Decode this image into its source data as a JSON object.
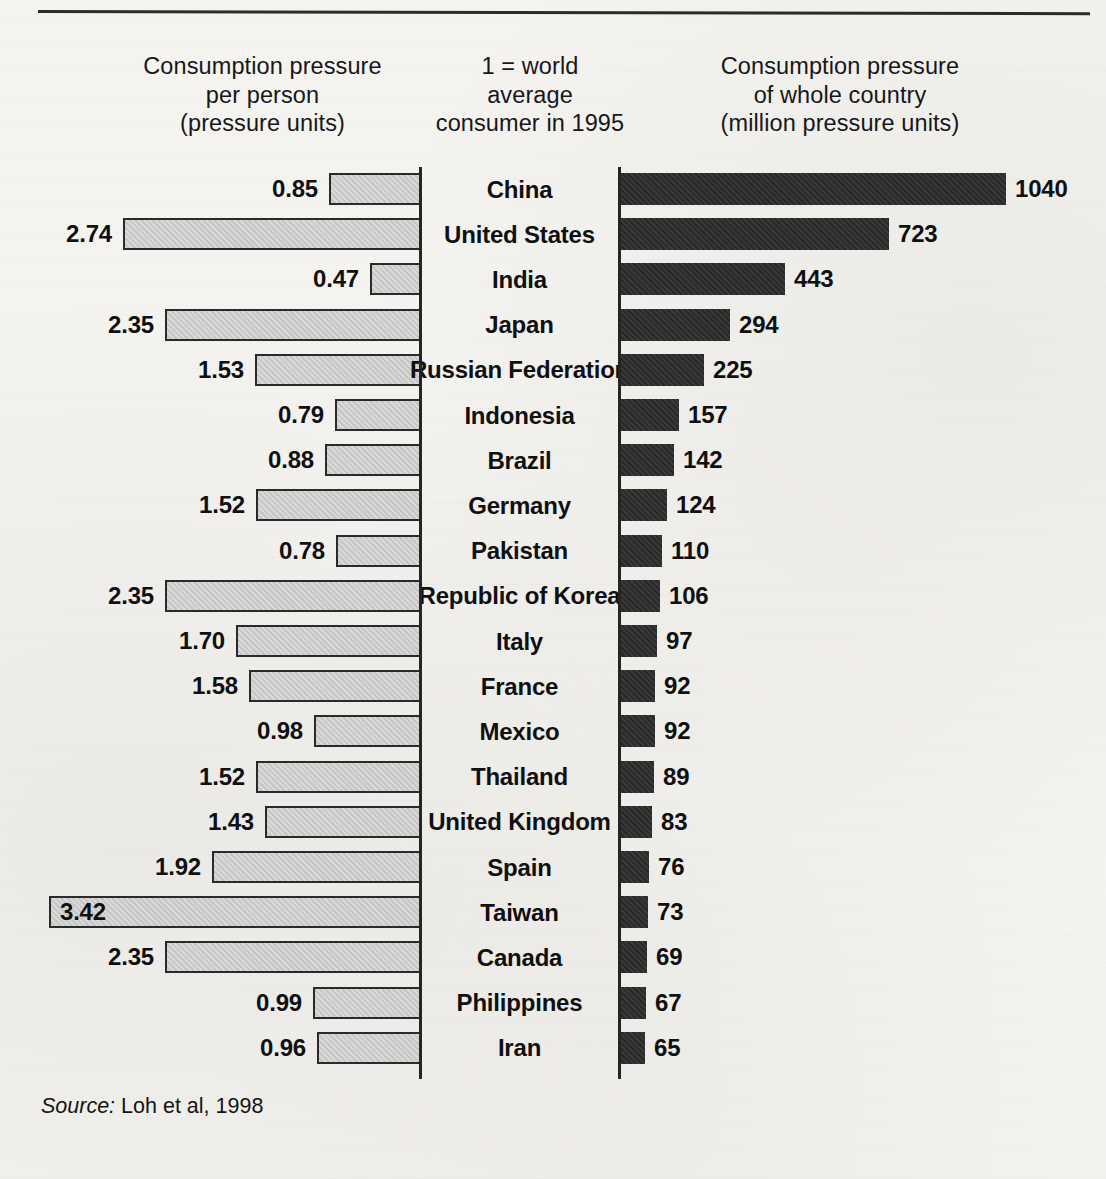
{
  "figure": {
    "top_rule": true,
    "source_label": "Source:",
    "source_text": "Loh et al, 1998"
  },
  "headers": {
    "left": [
      "Consumption pressure",
      "per person",
      "(pressure units)"
    ],
    "middle": [
      "1 = world",
      "average",
      "consumer in 1995"
    ],
    "right": [
      "Consumption pressure",
      "of whole country",
      "(million pressure units)"
    ]
  },
  "colors": {
    "page_background": "#f4f3f0",
    "left_bar_fill": "#c9c9c9",
    "left_bar_stroke": "#2a2a2a",
    "right_bar_fill": "#2d2d2d",
    "axis": "#252525",
    "text": "#101010"
  },
  "chart_data": {
    "type": "bar",
    "title": "",
    "orientation": "horizontal",
    "layout": "bidirectional paired bars, categories centered between two panels",
    "categories": [
      "China",
      "United States",
      "India",
      "Japan",
      "Russian Federation",
      "Indonesia",
      "Brazil",
      "Germany",
      "Pakistan",
      "Republic of Korea",
      "Italy",
      "France",
      "Mexico",
      "Thailand",
      "United Kingdom",
      "Spain",
      "Taiwan",
      "Canada",
      "Philippines",
      "Iran"
    ],
    "series": [
      {
        "name": "Consumption pressure per person (pressure units)",
        "panel": "left",
        "direction": "right-to-left",
        "xlabel": "Consumption pressure per person (pressure units)",
        "note": "1 = world average consumer in 1995",
        "xlim": [
          0,
          3.42
        ],
        "values": [
          0.85,
          2.74,
          0.47,
          2.35,
          1.53,
          0.79,
          0.88,
          1.52,
          0.78,
          2.35,
          1.7,
          1.58,
          0.98,
          1.52,
          1.43,
          1.92,
          3.42,
          2.35,
          0.99,
          0.96
        ],
        "labels": [
          "0.85",
          "2.74",
          "0.47",
          "2.35",
          "1.53",
          "0.79",
          "0.88",
          "1.52",
          "0.78",
          "2.35",
          "1.70",
          "1.58",
          "0.98",
          "1.52",
          "1.43",
          "1.92",
          "3.42",
          "2.35",
          "0.99",
          "0.96"
        ]
      },
      {
        "name": "Consumption pressure of whole country (million pressure units)",
        "panel": "right",
        "direction": "left-to-right",
        "xlabel": "Consumption pressure of whole country (million pressure units)",
        "xlim": [
          0,
          1040
        ],
        "values": [
          1040,
          723,
          443,
          294,
          225,
          157,
          142,
          124,
          110,
          106,
          97,
          92,
          92,
          89,
          83,
          76,
          73,
          69,
          67,
          65
        ],
        "labels": [
          "1040",
          "723",
          "443",
          "294",
          "225",
          "157",
          "142",
          "124",
          "110",
          "106",
          "97",
          "92",
          "92",
          "89",
          "83",
          "76",
          "73",
          "69",
          "67",
          "65"
        ]
      }
    ],
    "grid": false,
    "legend": "none"
  }
}
